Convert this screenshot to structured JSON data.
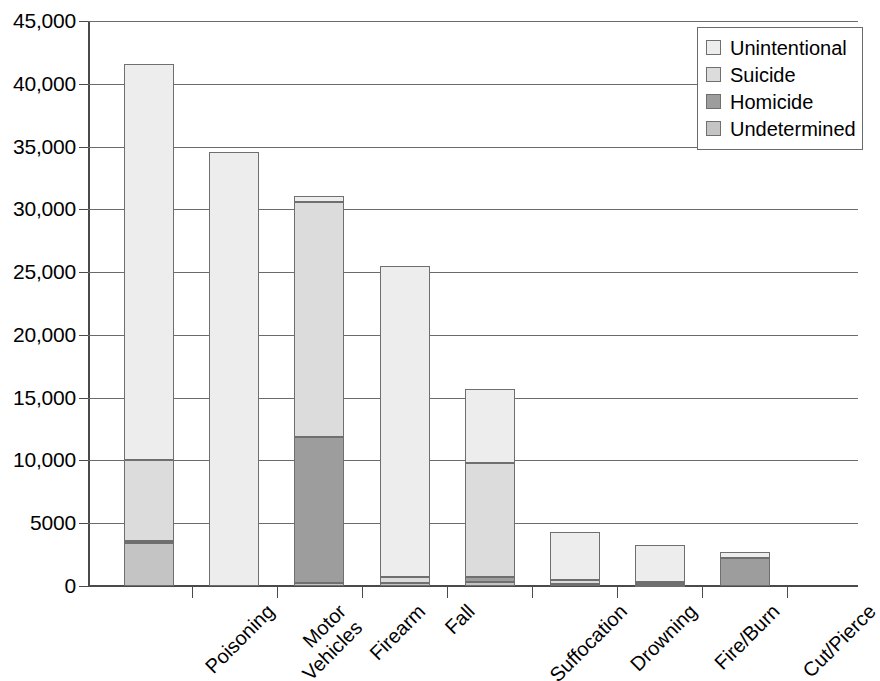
{
  "chart_data": {
    "type": "bar",
    "subtype": "stacked-bar",
    "title": "",
    "xlabel": "",
    "ylabel": "",
    "ylim": [
      0,
      45000
    ],
    "ytick_labels": [
      "45,000",
      "40,000",
      "35,000",
      "30,000",
      "25,000",
      "20,000",
      "15,000",
      "10,000",
      "5000",
      "0"
    ],
    "ytick_values": [
      45000,
      40000,
      35000,
      30000,
      25000,
      20000,
      15000,
      10000,
      5000,
      0
    ],
    "grid": true,
    "legend_position": "top-right",
    "categories": [
      "Poisoning",
      "Motor\nVehicles",
      "Firearm",
      "Fall",
      "Suffocation",
      "Drowning",
      "Fire/Burn",
      "Cut/Pierce"
    ],
    "series": [
      {
        "name": "Unintentional",
        "color": "#ededed",
        "values": [
          31600,
          34600,
          450,
          24800,
          5900,
          3800,
          3000,
          500
        ]
      },
      {
        "name": "Suicide",
        "color": "#dcdcdc",
        "values": [
          6450,
          0,
          18700,
          500,
          9100,
          350,
          150,
          0
        ]
      },
      {
        "name": "Homicide",
        "color": "#9d9d9d",
        "values": [
          150,
          0,
          11700,
          0,
          350,
          0,
          100,
          2200
        ]
      },
      {
        "name": "Undetermined",
        "color": "#c4c4c4",
        "values": [
          3400,
          0,
          200,
          200,
          350,
          150,
          50,
          0
        ]
      }
    ],
    "totals": [
      41600,
      34600,
      31050,
      25500,
      15700,
      4300,
      3300,
      2700
    ],
    "stack_order_bottom_to_top": [
      "Undetermined",
      "Homicide",
      "Suicide",
      "Unintentional"
    ]
  },
  "legend": {
    "items": [
      {
        "label": "Unintentional",
        "swatch_name": "legend-swatch-unintentional"
      },
      {
        "label": "Suicide",
        "swatch_name": "legend-swatch-suicide"
      },
      {
        "label": "Homicide",
        "swatch_name": "legend-swatch-homicide"
      },
      {
        "label": "Undetermined",
        "swatch_name": "legend-swatch-undetermined"
      }
    ]
  }
}
